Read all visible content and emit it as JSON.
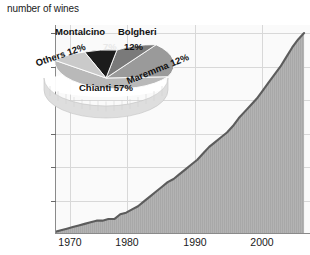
{
  "chart_data": [
    {
      "type": "area",
      "title": "number of wines",
      "xlabel": "",
      "ylabel": "number of wines",
      "grid": true,
      "legend_position": "none",
      "xlim": [
        1965,
        2008
      ],
      "ylim": [
        0,
        130
      ],
      "xticks": [
        1970,
        1980,
        1990,
        2000
      ],
      "yticks": [
        20,
        40,
        60,
        80,
        100,
        120
      ],
      "xtick_labels": [
        "1970",
        "1980",
        "1990",
        "2000"
      ],
      "ytick_labels": [
        "20",
        "40",
        "60",
        "80",
        "100",
        "120"
      ],
      "series": [
        {
          "name": "number of wines",
          "x": [
            1965,
            1966,
            1967,
            1968,
            1969,
            1970,
            1971,
            1972,
            1973,
            1974,
            1975,
            1976,
            1977,
            1978,
            1979,
            1980,
            1981,
            1982,
            1983,
            1984,
            1985,
            1986,
            1987,
            1988,
            1989,
            1990,
            1991,
            1992,
            1993,
            1994,
            1995,
            1996,
            1997,
            1998,
            1999,
            2000,
            2001,
            2002,
            2003,
            2004,
            2005,
            2006,
            2007
          ],
          "values": [
            1,
            2,
            3,
            4,
            5,
            6,
            7,
            8,
            8,
            9,
            9,
            12,
            13,
            15,
            17,
            20,
            23,
            26,
            29,
            32,
            34,
            37,
            40,
            43,
            46,
            50,
            54,
            57,
            60,
            63,
            67,
            72,
            76,
            80,
            84,
            89,
            94,
            99,
            104,
            110,
            116,
            121,
            125
          ]
        }
      ],
      "line_color": "#5c5c5c",
      "area_color": "#b0b0b0",
      "grid_color": "#d6d6d6"
    },
    {
      "type": "pie",
      "title": "",
      "labels": [
        "Chianti",
        "Maremma",
        "Bolgheri",
        "Montalcino",
        "Others"
      ],
      "values": [
        57,
        12,
        12,
        7,
        12
      ],
      "value_labels": [
        "Chianti 57%",
        "Maremma 12%",
        "Bolgheri 12%",
        "7%",
        "Others 12%"
      ],
      "display_labels": [
        "Chianti 57%",
        "Maremma 12%",
        "Bolgheri",
        "Montalcino",
        "Others 12%"
      ],
      "slice_colors": [
        "#b9b9b9",
        "#9a9a9a",
        "#7a7a7a",
        "#1c1c1c",
        "#c9c9c9"
      ],
      "legend_position": "labels-on-slices"
    }
  ],
  "axis": {
    "y_title": "number of wines",
    "yticks": [
      "120",
      "100",
      "80",
      "60",
      "40",
      "20"
    ],
    "xticks": [
      "1970",
      "1980",
      "1990",
      "2000"
    ]
  },
  "pie": {
    "montalcino_name": "Montalcino",
    "montalcino_pct": "7%",
    "bolgheri_name": "Bolgheri",
    "bolgheri_pct": "12%",
    "maremma_label": "Maremma 12%",
    "others_label": "Others 12%",
    "chianti_label": "Chianti 57%"
  }
}
